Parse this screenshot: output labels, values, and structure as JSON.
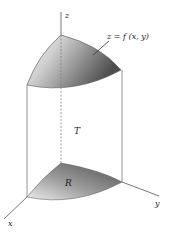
{
  "diagram": {
    "labels": {
      "z_axis": "z",
      "x_axis": "x",
      "y_axis": "y",
      "surface": "z = f (x, y)",
      "solid": "T",
      "region": "R"
    },
    "colors": {
      "stroke": "#555555",
      "shade_dark": "#5a5a5a",
      "shade_light": "#f2f2f2",
      "background": "#ffffff"
    }
  }
}
